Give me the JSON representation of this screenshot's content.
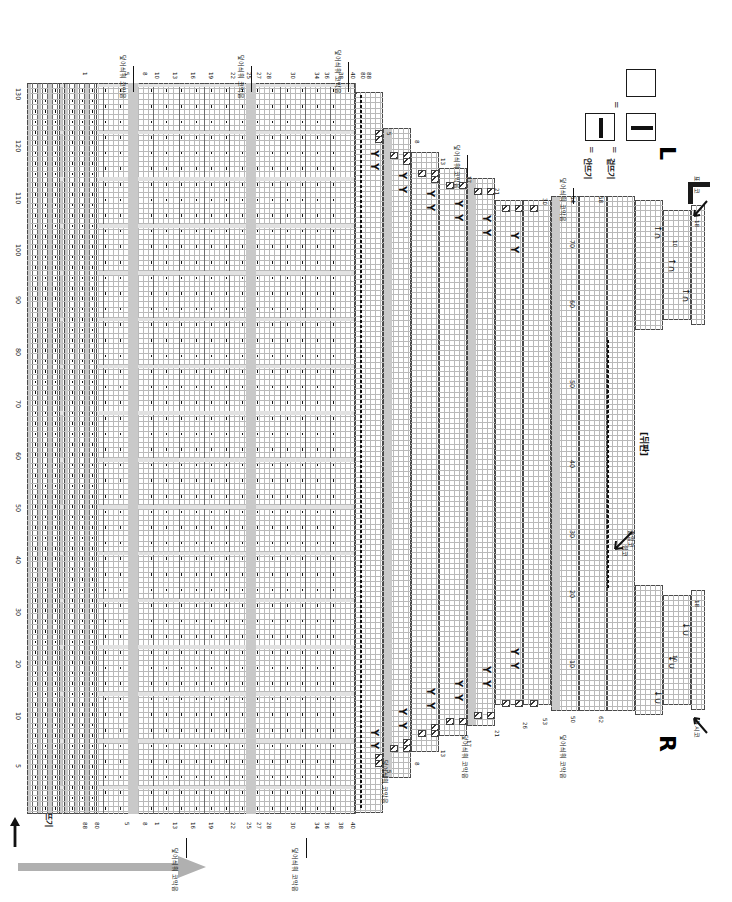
{
  "document": {
    "type": "knitting-chart",
    "orientation": "rotated-90",
    "title_back": "[뒤판]",
    "rib_label_bottom": "고무뜨기",
    "rib_label_center": "26코 고무뜨기"
  },
  "legend": {
    "items": [
      {
        "symbol": "empty-box",
        "equals": "",
        "label": ""
      },
      {
        "symbol": "horizontal-bar-box",
        "equals": "=",
        "label": "겉뜨기"
      },
      {
        "symbol": "vertical-bar-box",
        "equals": "=",
        "label": "안뜨기"
      }
    ]
  },
  "side_labels": {
    "left": "L",
    "right": "R"
  },
  "annotations": {
    "cast_off": "덮어씌워 코막음",
    "decrease": "줄임코",
    "pickup": "쉼코",
    "stitch_marker": "표시코",
    "center": "중심"
  },
  "chart_data": {
    "type": "table",
    "row_axis_labels": [
      5,
      10,
      15,
      20,
      25,
      30,
      40,
      50,
      60,
      70,
      80,
      90,
      100,
      110
    ],
    "column_axis_labels": [
      1,
      5,
      10,
      13,
      17,
      21,
      26,
      30,
      34,
      40,
      50,
      54,
      58,
      62,
      66,
      70,
      80
    ],
    "row_tick_max": 130,
    "col_tick_max": 88,
    "notes": [
      "1",
      "5",
      "8",
      "13",
      "17",
      "21",
      "26",
      "30",
      "34",
      "40",
      "50",
      "53",
      "54",
      "58",
      "62",
      "66",
      "70",
      "80",
      "88"
    ],
    "symbols": {
      "purl": "|",
      "knit": "—",
      "decrease_right": "Y",
      "bind_off": "↑∩",
      "bind_off_alt": "↓∪"
    }
  }
}
